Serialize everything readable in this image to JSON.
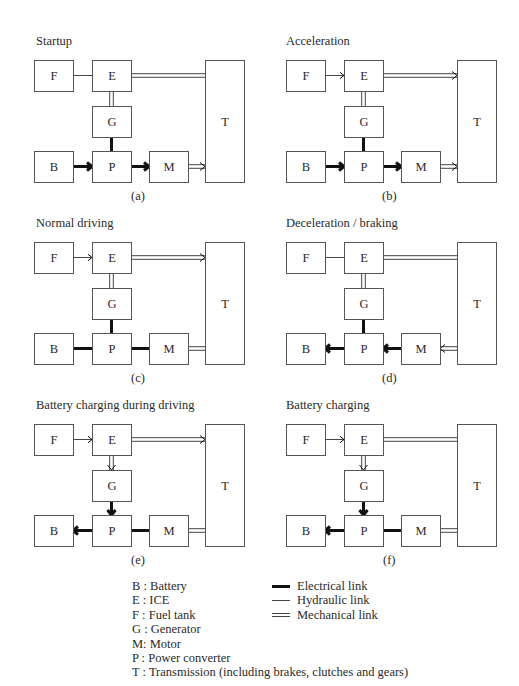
{
  "panels": [
    {
      "id": "a",
      "title": "Startup",
      "caption": "(a)",
      "links": {
        "FE": "hydraulic",
        "ET": "mechanical",
        "EG": "mechanical",
        "GP": "electrical",
        "BP": "electrical-arrow-right",
        "PM": "electrical-arrow-right",
        "MT": "mechanical-arrow-right"
      }
    },
    {
      "id": "b",
      "title": "Acceleration",
      "caption": "(b)",
      "links": {
        "FE": "hydraulic-arrow-right",
        "ET": "mechanical-arrow-right",
        "EG": "mechanical",
        "GP": "electrical",
        "BP": "electrical-arrow-right",
        "PM": "electrical-arrow-right",
        "MT": "mechanical-arrow-right"
      }
    },
    {
      "id": "c",
      "title": "Normal driving",
      "caption": "(c)",
      "links": {
        "FE": "hydraulic-arrow-right",
        "ET": "mechanical-arrow-right",
        "EG": "mechanical",
        "GP": "electrical",
        "BP": "electrical",
        "PM": "electrical",
        "MT": "mechanical"
      }
    },
    {
      "id": "d",
      "title": "Deceleration / braking",
      "caption": "(d)",
      "links": {
        "FE": "hydraulic",
        "ET": "mechanical",
        "EG": "mechanical",
        "GP": "electrical",
        "BP": "electrical-arrow-left",
        "PM": "electrical-arrow-left",
        "MT": "mechanical-arrow-left"
      }
    },
    {
      "id": "e",
      "title": "Battery charging during driving",
      "caption": "(e)",
      "links": {
        "FE": "hydraulic-arrow-right",
        "ET": "mechanical-arrow-right",
        "EG": "mechanical-arrow-down",
        "GP": "electrical-arrow-down",
        "BP": "electrical-arrow-left",
        "PM": "electrical",
        "MT": "mechanical"
      }
    },
    {
      "id": "f",
      "title": "Battery charging",
      "caption": "(f)",
      "links": {
        "FE": "hydraulic-arrow-right",
        "ET": "mechanical",
        "EG": "mechanical-arrow-down",
        "GP": "electrical-arrow-down",
        "BP": "electrical-arrow-left",
        "PM": "electrical",
        "MT": "mechanical"
      }
    }
  ],
  "blocks": {
    "F": "F",
    "E": "E",
    "G": "G",
    "B": "B",
    "P": "P",
    "M": "M",
    "T": "T"
  },
  "legend": {
    "abbreviations": [
      "B : Battery",
      "E : ICE",
      "F : Fuel tank",
      "G : Generator",
      "M: Motor",
      "P : Power converter",
      "T : Transmission (including brakes, clutches and gears)"
    ],
    "link_types": [
      {
        "type": "electrical",
        "label": "Electrical link"
      },
      {
        "type": "hydraulic",
        "label": "Hydraulic link"
      },
      {
        "type": "mechanical",
        "label": "Mechanical link"
      }
    ]
  },
  "colors": {
    "line": "#111111",
    "box_stroke": "#555555",
    "thin_line": "#444444",
    "background": "#ffffff"
  }
}
